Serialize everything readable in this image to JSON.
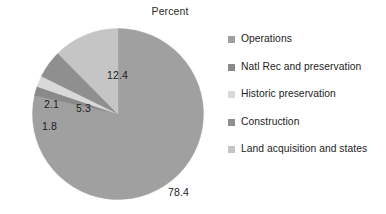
{
  "chart_data": {
    "type": "pie",
    "title": "Percent",
    "xlabel": "",
    "ylabel": "",
    "legend_position": "right",
    "grid": false,
    "start_angle_deg": 0,
    "direction": "clockwise",
    "categories": [
      "Operations",
      "Natl Rec and preservation",
      "Historic preservation",
      "Construction",
      "Land acquisition and states"
    ],
    "values": [
      78.4,
      1.8,
      2.1,
      5.3,
      12.4
    ],
    "data_labels": [
      "78.4",
      "1.8",
      "2.1",
      "5.3",
      "12.4"
    ],
    "colors": [
      "#a0a0a0",
      "#8a8a8a",
      "#d9d9d9",
      "#8f8f8f",
      "#c5c5c5"
    ],
    "slices": [
      {
        "label": "Operations",
        "value": 78.4,
        "display": "78.4",
        "color": "#a0a0a0"
      },
      {
        "label": "Natl Rec and preservation",
        "value": 1.8,
        "display": "1.8",
        "color": "#8a8a8a"
      },
      {
        "label": "Historic preservation",
        "value": 2.1,
        "display": "2.1",
        "color": "#d9d9d9"
      },
      {
        "label": "Construction",
        "value": 5.3,
        "display": "5.3",
        "color": "#8f8f8f"
      },
      {
        "label": "Land acquisition and states",
        "value": 12.4,
        "display": "12.4",
        "color": "#c5c5c5"
      }
    ],
    "total": 100.0
  },
  "title": {
    "text": "Percent"
  },
  "legend": {
    "items": [
      {
        "label": "Operations",
        "color": "#a0a0a0"
      },
      {
        "label": "Natl Rec and preservation",
        "color": "#8a8a8a"
      },
      {
        "label": "Historic preservation",
        "color": "#d9d9d9"
      },
      {
        "label": "Construction",
        "color": "#8f8f8f"
      },
      {
        "label": "Land acquisition and states",
        "color": "#c5c5c5"
      }
    ]
  },
  "labels": {
    "operations": "78.4",
    "land": "12.4",
    "construction": "5.3",
    "historic": "2.1",
    "natlrec": "1.8"
  },
  "colors": {
    "background": "#ffffff",
    "text": "#1d1d1d",
    "pie_outline": "#9a9a9a"
  }
}
